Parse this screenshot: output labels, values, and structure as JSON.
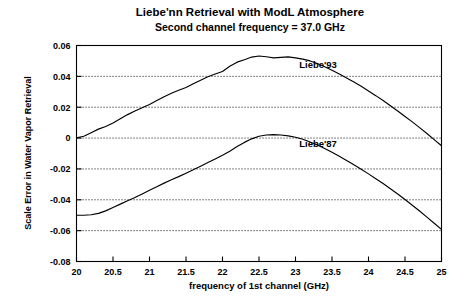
{
  "chart_data": {
    "type": "line",
    "title": "Liebe'nn Retrieval with ModL Atmosphere",
    "subtitle": "Second channel frequency = 37.0 GHz",
    "xlabel": "frequency of 1st channel (GHz)",
    "ylabel": "Scale Error in Water Vapor Retrieval",
    "xlim": [
      20,
      25
    ],
    "ylim": [
      -0.08,
      0.06
    ],
    "grid": true,
    "grid_axis": "y",
    "legend_position": "inline-annotation",
    "xticks": [
      "20",
      "20.5",
      "21",
      "21.5",
      "22",
      "22.5",
      "23",
      "23.5",
      "24",
      "24.5",
      "25"
    ],
    "xtick_values": [
      20,
      20.5,
      21,
      21.5,
      22,
      22.5,
      23,
      23.5,
      24,
      24.5,
      25
    ],
    "yticks": [
      "0.06",
      "0.04",
      "0.02",
      "0",
      "-0.02",
      "-0.04",
      "-0.06",
      "-0.08"
    ],
    "ytick_values": [
      0.06,
      0.04,
      0.02,
      0,
      -0.02,
      -0.04,
      -0.06,
      -0.08
    ],
    "x": [
      20.0,
      20.1,
      20.2,
      20.3,
      20.4,
      20.5,
      20.6,
      20.7,
      20.8,
      20.9,
      21.0,
      21.1,
      21.2,
      21.3,
      21.4,
      21.5,
      21.6,
      21.7,
      21.8,
      21.9,
      22.0,
      22.1,
      22.2,
      22.3,
      22.4,
      22.5,
      22.6,
      22.7,
      22.8,
      22.9,
      23.0,
      23.1,
      23.2,
      23.3,
      23.4,
      23.5,
      23.6,
      23.7,
      23.8,
      23.9,
      24.0,
      24.1,
      24.2,
      24.3,
      24.4,
      24.5,
      24.6,
      24.7,
      24.8,
      24.9,
      25.0
    ],
    "series": [
      {
        "name": "Liebe'93",
        "annotation": "Liebe'93",
        "annotation_x": 23.05,
        "annotation_y": 0.0455,
        "values": [
          0.0002,
          0.0012,
          0.0035,
          0.0058,
          0.0075,
          0.0098,
          0.0125,
          0.0152,
          0.0175,
          0.0196,
          0.0218,
          0.0243,
          0.0268,
          0.029,
          0.031,
          0.0328,
          0.0352,
          0.0375,
          0.0397,
          0.0415,
          0.0432,
          0.0465,
          0.0492,
          0.0508,
          0.0525,
          0.0532,
          0.0527,
          0.052,
          0.0523,
          0.0526,
          0.052,
          0.0512,
          0.05,
          0.0483,
          0.0462,
          0.044,
          0.0415,
          0.039,
          0.0363,
          0.0336,
          0.0305,
          0.0275,
          0.0243,
          0.021,
          0.0176,
          0.014,
          0.0105,
          0.0068,
          0.003,
          -0.001,
          -0.005
        ]
      },
      {
        "name": "Liebe'87",
        "annotation": "Liebe'87",
        "annotation_x": 23.05,
        "annotation_y": -0.0055,
        "values": [
          -0.05,
          -0.05,
          -0.0497,
          -0.0488,
          -0.0472,
          -0.045,
          -0.0428,
          -0.0406,
          -0.0385,
          -0.0362,
          -0.0338,
          -0.0315,
          -0.0292,
          -0.027,
          -0.025,
          -0.0228,
          -0.0205,
          -0.0182,
          -0.0158,
          -0.0135,
          -0.0112,
          -0.0085,
          -0.0055,
          -0.0028,
          -0.0005,
          0.0012,
          0.002,
          0.0022,
          0.002,
          0.0014,
          0.0005,
          -0.0008,
          -0.0025,
          -0.0045,
          -0.0068,
          -0.0092,
          -0.0118,
          -0.0145,
          -0.0173,
          -0.0202,
          -0.0232,
          -0.0263,
          -0.0295,
          -0.0328,
          -0.0362,
          -0.0398,
          -0.0435,
          -0.0473,
          -0.0512,
          -0.0552,
          -0.0592
        ]
      }
    ]
  }
}
